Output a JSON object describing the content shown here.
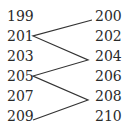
{
  "left_column": [
    "199",
    "201",
    "203",
    "205",
    "207",
    "209"
  ],
  "right_column": [
    "200",
    "202",
    "204",
    "206",
    "208",
    "210"
  ],
  "connections": [
    "200-201",
    "201-204",
    "204-205",
    "205-208",
    "208-209"
  ],
  "line_color": "#333333"
}
